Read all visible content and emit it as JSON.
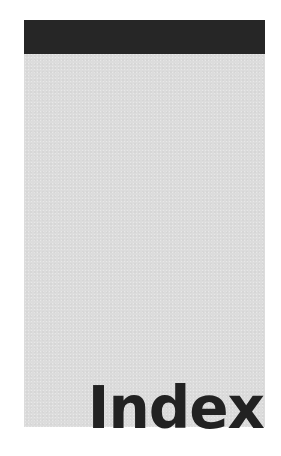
{
  "page": {
    "title": "Index",
    "colors": {
      "band": "#262626",
      "panel": "#dcdcdc",
      "text": "#222222",
      "background": "#ffffff"
    }
  }
}
